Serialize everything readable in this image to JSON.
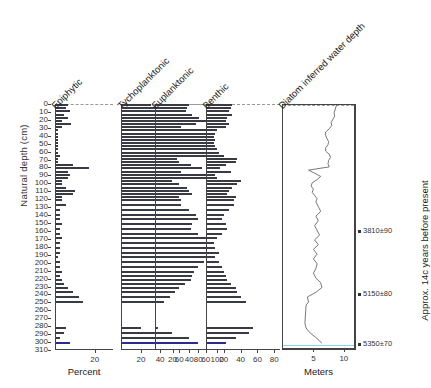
{
  "figure": {
    "y_axis_label": "Natural depth (cm)",
    "right_axis_label": "Approx. 14c years before present",
    "y_ticks": [
      0,
      10,
      20,
      30,
      40,
      50,
      60,
      70,
      80,
      90,
      100,
      110,
      120,
      130,
      140,
      150,
      160,
      170,
      180,
      190,
      200,
      210,
      220,
      230,
      240,
      250,
      260,
      270,
      280,
      290,
      300,
      310
    ],
    "y_range": [
      0,
      310
    ]
  },
  "panels": [
    {
      "title": "Epiphytic",
      "axis_caption": "Percent",
      "x_ticks": [
        20
      ],
      "x_range": [
        0,
        30
      ],
      "type": "bar"
    },
    {
      "title": "Tychoplanktonic",
      "axis_caption": "",
      "x_ticks": [
        20,
        40,
        60,
        80,
        100
      ],
      "x_range": [
        0,
        105
      ],
      "type": "bar"
    },
    {
      "title": "Euplanktonic",
      "axis_caption": "",
      "x_ticks": [
        20,
        40,
        60
      ],
      "x_range": [
        0,
        70
      ],
      "type": "bar"
    },
    {
      "title": "Benthic",
      "axis_caption": "",
      "x_ticks": [
        20,
        40,
        60,
        80
      ],
      "x_range": [
        0,
        88
      ],
      "type": "bar"
    },
    {
      "title": "Diatom inferred water depth",
      "axis_caption": "Meters",
      "x_ticks": [
        5,
        10
      ],
      "x_range": [
        0,
        12
      ],
      "type": "line"
    }
  ],
  "dates": [
    {
      "label": "3810±90",
      "depth": 160
    },
    {
      "label": "5150±80",
      "depth": 240
    },
    {
      "label": "5350±70",
      "depth": 303
    }
  ],
  "chart_data": {
    "type": "bar",
    "ylabel": "Natural depth (cm)",
    "ylim": [
      0,
      310
    ],
    "y_inverted": true,
    "depths": [
      0,
      4,
      8,
      12,
      16,
      20,
      24,
      28,
      32,
      36,
      40,
      44,
      48,
      52,
      56,
      60,
      64,
      68,
      72,
      76,
      80,
      84,
      88,
      92,
      96,
      100,
      104,
      108,
      112,
      116,
      120,
      126,
      132,
      138,
      144,
      150,
      156,
      162,
      168,
      174,
      180,
      186,
      192,
      198,
      204,
      210,
      215,
      220,
      225,
      230,
      236,
      242,
      248,
      275,
      281,
      287,
      293,
      300
    ],
    "series": [
      {
        "name": "Epiphytic",
        "xlabel": "Percent",
        "xlim": [
          0,
          30
        ],
        "values": [
          6,
          5,
          7,
          4,
          6,
          3,
          8,
          3,
          1,
          1,
          1,
          1,
          1,
          1,
          1,
          1,
          2,
          1,
          1,
          9,
          17,
          6,
          7,
          6,
          3,
          3,
          5,
          10,
          9,
          3,
          3,
          5,
          2,
          2,
          2,
          3,
          2,
          2,
          3,
          2,
          2,
          2,
          1,
          2,
          2,
          3,
          2,
          3,
          4,
          6,
          9,
          12,
          14,
          0,
          5,
          4,
          2,
          7
        ]
      },
      {
        "name": "Tychoplanktonic",
        "xlim": [
          0,
          105
        ],
        "values": [
          30,
          44,
          50,
          56,
          42,
          62,
          36,
          60,
          92,
          96,
          97,
          98,
          97,
          96,
          96,
          95,
          93,
          58,
          60,
          72,
          84,
          62,
          97,
          93,
          52,
          60,
          68,
          70,
          74,
          60,
          62,
          62,
          70,
          78,
          80,
          74,
          72,
          80,
          90,
          96,
          94,
          88,
          98,
          86,
          80,
          76,
          74,
          72,
          66,
          60,
          56,
          50,
          44,
          0,
          20,
          52,
          70,
          80
        ]
      },
      {
        "name": "Euplanktonic",
        "xlim": [
          0,
          70
        ],
        "values": [
          40,
          38,
          36,
          44,
          52,
          60,
          48,
          30,
          2,
          2,
          2,
          2,
          2,
          2,
          2,
          2,
          2,
          2,
          2,
          6,
          4,
          2,
          2,
          2,
          2,
          2,
          2,
          2,
          2,
          2,
          2,
          2,
          2,
          2,
          2,
          2,
          2,
          2,
          2,
          2,
          2,
          2,
          2,
          2,
          2,
          2,
          2,
          2,
          2,
          2,
          2,
          2,
          2,
          0,
          2,
          2,
          2,
          2
        ]
      },
      {
        "name": "Benthic",
        "xlim": [
          0,
          88
        ],
        "values": [
          30,
          28,
          26,
          30,
          24,
          22,
          26,
          22,
          12,
          10,
          8,
          6,
          8,
          10,
          12,
          14,
          20,
          36,
          34,
          22,
          16,
          28,
          10,
          12,
          40,
          36,
          30,
          26,
          24,
          34,
          32,
          32,
          26,
          20,
          18,
          22,
          24,
          18,
          12,
          8,
          10,
          14,
          8,
          14,
          18,
          20,
          22,
          24,
          28,
          34,
          36,
          40,
          46,
          0,
          55,
          50,
          34,
          22
        ]
      }
    ],
    "depth_curve": {
      "name": "Diatom inferred water depth",
      "xlabel": "Meters",
      "xlim": [
        0,
        12
      ],
      "x_ticks": [
        5,
        10
      ],
      "depths": [
        0,
        5,
        10,
        14,
        18,
        22,
        26,
        30,
        34,
        38,
        42,
        46,
        50,
        54,
        58,
        62,
        66,
        70,
        74,
        78,
        82,
        86,
        90,
        94,
        98,
        102,
        106,
        110,
        114,
        118,
        122,
        128,
        134,
        140,
        146,
        152,
        158,
        164,
        170,
        176,
        182,
        188,
        194,
        200,
        206,
        212,
        218,
        224,
        230,
        236,
        242,
        248,
        252,
        275,
        281,
        287,
        293,
        300
      ],
      "meters": [
        8.8,
        8.6,
        8.4,
        8.5,
        8.2,
        7.9,
        8.0,
        7.6,
        7.0,
        7.0,
        7.2,
        7.5,
        7.4,
        7.0,
        7.0,
        7.6,
        7.8,
        7.5,
        7.4,
        7.6,
        4.2,
        5.2,
        6.2,
        5.6,
        4.8,
        4.6,
        5.0,
        4.8,
        5.2,
        5.6,
        5.4,
        5.8,
        6.2,
        5.4,
        5.8,
        5.2,
        5.6,
        6.0,
        5.2,
        5.8,
        5.0,
        5.6,
        5.0,
        5.6,
        5.4,
        5.0,
        5.4,
        6.2,
        6.4,
        5.4,
        4.0,
        4.2,
        3.8,
        3.6,
        3.8,
        4.4,
        5.4,
        6.4
      ]
    }
  }
}
